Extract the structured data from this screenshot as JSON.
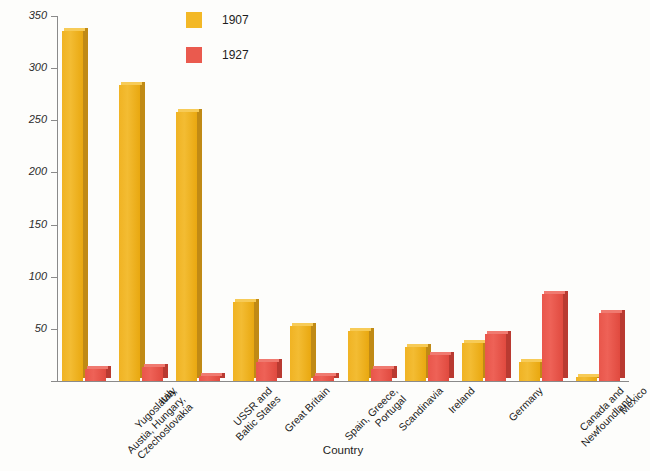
{
  "chart_data": {
    "type": "bar",
    "title": "",
    "xlabel": "Country",
    "ylabel": "Immigrants (in Thousands)",
    "ylim": [
      0,
      350
    ],
    "yticks": [
      0,
      50,
      100,
      150,
      200,
      250,
      300,
      350
    ],
    "ytick_labels": [
      "",
      "50",
      "100",
      "150",
      "200",
      "250",
      "300",
      "350"
    ],
    "grid": false,
    "legend_position": "top-center",
    "categories": [
      "Yugoslavia,\nAustia, Hungary,\nCzechoslovakia",
      "Italy",
      "USSR and\nBaltic States",
      "Great Britain",
      "Spain, Greece,\nPortugal",
      "Scandinavia",
      "Ireland",
      "Germany",
      "Canada and\nNewfoundland",
      "Mexico"
    ],
    "series": [
      {
        "name": "1907",
        "color": "#f3b826",
        "values": [
          336,
          284,
          258,
          76,
          53,
          48,
          33,
          36,
          18,
          4
        ]
      },
      {
        "name": "1927",
        "color": "#ea5a4e",
        "values": [
          12,
          13,
          5,
          18,
          5,
          12,
          25,
          45,
          83,
          65
        ]
      }
    ]
  },
  "legend": {
    "items": [
      {
        "label": "1907",
        "color": "#f3b826"
      },
      {
        "label": "1927",
        "color": "#ea5a4e"
      }
    ]
  },
  "axes": {
    "y_title": "Immigrants (in Thousands)",
    "x_title": "Country"
  }
}
